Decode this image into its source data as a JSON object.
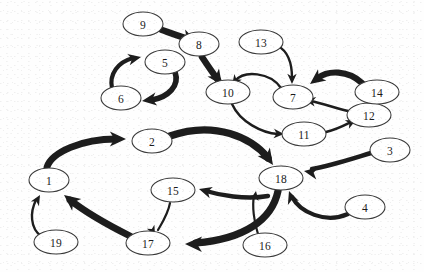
{
  "diagram": {
    "type": "directed-graph",
    "background_color": "#ffffff",
    "node_fill_color": "#ffffff",
    "node_stroke_color": "#3a3a3a",
    "edge_color": "#1d1d1d",
    "label_color": "#1b1b1b",
    "node_count": 19,
    "edge_count": 17,
    "nodes": [
      {
        "id": "1",
        "label": "1",
        "cx": 49,
        "cy": 180,
        "rx": 20,
        "ry": 12
      },
      {
        "id": "2",
        "label": "2",
        "cx": 152,
        "cy": 141,
        "rx": 20,
        "ry": 12
      },
      {
        "id": "3",
        "label": "3",
        "cx": 390,
        "cy": 150,
        "rx": 20,
        "ry": 12
      },
      {
        "id": "4",
        "label": "4",
        "cx": 365,
        "cy": 207,
        "rx": 20,
        "ry": 12
      },
      {
        "id": "5",
        "label": "5",
        "cx": 165,
        "cy": 62,
        "rx": 20,
        "ry": 12
      },
      {
        "id": "6",
        "label": "6",
        "cx": 121,
        "cy": 98,
        "rx": 20,
        "ry": 12
      },
      {
        "id": "7",
        "label": "7",
        "cx": 293,
        "cy": 97,
        "rx": 20,
        "ry": 12
      },
      {
        "id": "8",
        "label": "8",
        "cx": 199,
        "cy": 44,
        "rx": 20,
        "ry": 12
      },
      {
        "id": "9",
        "label": "9",
        "cx": 143,
        "cy": 24,
        "rx": 20,
        "ry": 12
      },
      {
        "id": "10",
        "label": "10",
        "cx": 228,
        "cy": 92,
        "rx": 22,
        "ry": 12
      },
      {
        "id": "11",
        "label": "11",
        "cx": 304,
        "cy": 134,
        "rx": 22,
        "ry": 12
      },
      {
        "id": "12",
        "label": "12",
        "cx": 369,
        "cy": 115,
        "rx": 22,
        "ry": 12
      },
      {
        "id": "13",
        "label": "13",
        "cx": 261,
        "cy": 42,
        "rx": 22,
        "ry": 12
      },
      {
        "id": "14",
        "label": "14",
        "cx": 377,
        "cy": 92,
        "rx": 22,
        "ry": 12
      },
      {
        "id": "15",
        "label": "15",
        "cx": 173,
        "cy": 190,
        "rx": 22,
        "ry": 12
      },
      {
        "id": "16",
        "label": "16",
        "cx": 265,
        "cy": 245,
        "rx": 22,
        "ry": 12
      },
      {
        "id": "17",
        "label": "17",
        "cx": 148,
        "cy": 243,
        "rx": 22,
        "ry": 12
      },
      {
        "id": "18",
        "label": "18",
        "cx": 281,
        "cy": 178,
        "rx": 22,
        "ry": 12
      },
      {
        "id": "19",
        "label": "19",
        "cx": 56,
        "cy": 242,
        "rx": 22,
        "ry": 12
      }
    ],
    "edges": [
      {
        "id": "e9-8",
        "from": "9",
        "to": "8",
        "weight": "thick",
        "width": 6.5,
        "path": "M 162 30 C 176 35 184 38 192 40",
        "head": {
          "x": 196,
          "y": 41,
          "angle": 22,
          "size": 8.5
        }
      },
      {
        "id": "e8-10",
        "from": "8",
        "to": "10",
        "weight": "thick",
        "width": 6.5,
        "path": "M 202 57 C 208 66 212 72 218 80",
        "head": {
          "x": 222,
          "y": 85,
          "angle": 55,
          "size": 9
        }
      },
      {
        "id": "e6-5",
        "from": "6",
        "to": "5",
        "weight": "medium",
        "width": 4.2,
        "path": "M 112 88 C 109 74 118 62 133 58",
        "head": {
          "x": 141,
          "y": 57,
          "angle": -12,
          "size": 7.5
        }
      },
      {
        "id": "e5-6",
        "from": "5",
        "to": "6",
        "weight": "thick",
        "width": 5.6,
        "path": "M 175 72 C 180 86 168 97 152 100",
        "head": {
          "x": 142,
          "y": 101,
          "angle": 172,
          "size": 8.5
        }
      },
      {
        "id": "e7-10",
        "from": "7",
        "to": "10",
        "weight": "thin",
        "width": 2.4,
        "path": "M 281 88 C 270 72 244 70 235 81",
        "head": {
          "x": 232,
          "y": 85,
          "angle": 127,
          "size": 6
        }
      },
      {
        "id": "e13-7",
        "from": "13",
        "to": "7",
        "weight": "thin",
        "width": 2.4,
        "path": "M 278 46 C 289 52 292 66 292 78",
        "head": {
          "x": 292,
          "y": 84,
          "angle": 90,
          "size": 6
        }
      },
      {
        "id": "e14-7",
        "from": "14",
        "to": "7",
        "weight": "thick",
        "width": 6.2,
        "path": "M 362 83 C 348 70 328 70 318 78",
        "head": {
          "x": 310,
          "y": 84,
          "angle": 143,
          "size": 9
        }
      },
      {
        "id": "e10-11",
        "from": "10",
        "to": "11",
        "weight": "thin",
        "width": 2.4,
        "path": "M 232 104 C 240 122 262 133 278 134",
        "head": {
          "x": 284,
          "y": 134,
          "angle": 3,
          "size": 6
        }
      },
      {
        "id": "e11-12",
        "from": "11",
        "to": "12",
        "weight": "thin",
        "width": 2.6,
        "path": "M 326 132 C 338 129 345 125 351 122",
        "head": {
          "x": 356,
          "y": 120,
          "angle": -26,
          "size": 6
        }
      },
      {
        "id": "e12-7",
        "from": "12",
        "to": "7",
        "weight": "thin",
        "width": 2.6,
        "path": "M 348 111 C 333 107 320 103 311 101",
        "head": {
          "x": 305,
          "y": 100,
          "angle": 190,
          "size": 6.2
        }
      },
      {
        "id": "e1-2",
        "from": "1",
        "to": "2",
        "weight": "thick",
        "width": 6.8,
        "path": "M 47 167 C 52 152 82 139 116 139",
        "head": {
          "x": 126,
          "y": 139,
          "angle": 0,
          "size": 9.5
        }
      },
      {
        "id": "e2-18",
        "from": "2",
        "to": "18",
        "weight": "thick",
        "width": 7.2,
        "path": "M 170 136 C 215 120 252 138 268 158",
        "head": {
          "x": 273,
          "y": 165,
          "angle": 55,
          "size": 9.5
        }
      },
      {
        "id": "e3-18",
        "from": "3",
        "to": "18",
        "weight": "medium",
        "width": 4.6,
        "path": "M 371 153 C 348 160 330 166 312 169",
        "head": {
          "x": 304,
          "y": 171,
          "angle": 190,
          "size": 8
        }
      },
      {
        "id": "e4-18",
        "from": "4",
        "to": "18",
        "weight": "medium",
        "width": 4.2,
        "path": "M 348 214 C 325 224 300 212 292 197",
        "head": {
          "x": 289,
          "y": 191,
          "angle": 250,
          "size": 7.5
        }
      },
      {
        "id": "e16-18",
        "from": "16",
        "to": "18",
        "weight": "thin",
        "width": 2.2,
        "path": "M 258 234 C 254 222 252 206 254 196",
        "head": {
          "x": 256,
          "y": 191,
          "angle": 280,
          "size": 5.5
        }
      },
      {
        "id": "e18-17",
        "from": "18",
        "to": "17",
        "weight": "thick",
        "width": 7.2,
        "path": "M 278 191 C 272 220 244 239 196 243",
        "head": {
          "x": 185,
          "y": 244,
          "angle": 181,
          "size": 10
        }
      },
      {
        "id": "e15-17",
        "from": "15",
        "to": "17",
        "weight": "thin",
        "width": 2.2,
        "path": "M 170 203 C 168 214 162 223 158 230",
        "head": {
          "x": 155,
          "y": 235,
          "angle": 62,
          "size": 5.5
        }
      },
      {
        "id": "e18-15",
        "from": "18",
        "to": "15",
        "weight": "medium",
        "width": 4.4,
        "path": "M 268 196 C 245 200 219 195 206 191",
        "head": {
          "x": 199,
          "y": 189,
          "angle": 196,
          "size": 7.5
        }
      },
      {
        "id": "e17-1",
        "from": "17",
        "to": "1",
        "weight": "thick",
        "width": 6.8,
        "path": "M 130 236 C 110 226 88 214 70 200",
        "head": {
          "x": 64,
          "y": 195,
          "angle": 218,
          "size": 9.5
        }
      },
      {
        "id": "e19-1",
        "from": "19",
        "to": "1",
        "weight": "thin",
        "width": 2.4,
        "path": "M 41 236 C 30 228 30 212 36 200",
        "head": {
          "x": 40,
          "y": 195,
          "angle": 300,
          "size": 6
        }
      }
    ]
  }
}
